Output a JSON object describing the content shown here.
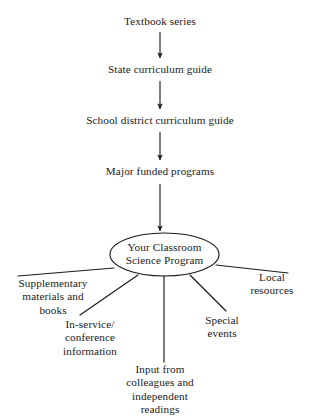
{
  "diagram": {
    "type": "flow-and-radial-diagram",
    "background_color": "#ffffff",
    "ink_color": "#1a1a1a",
    "flow": {
      "stages": [
        {
          "id": "textbook-series",
          "label": "Textbook series",
          "cx": 160,
          "cy": 22
        },
        {
          "id": "state-guide",
          "label": "State curriculum guide",
          "cx": 160,
          "cy": 70
        },
        {
          "id": "district-guide",
          "label": "School district curriculum guide",
          "cx": 160,
          "cy": 121
        },
        {
          "id": "funded-programs",
          "label": "Major funded programs",
          "cx": 160,
          "cy": 172
        }
      ],
      "arrows": [
        {
          "from": "textbook-series",
          "to": "state-guide",
          "x": 160,
          "y1": 32,
          "y2": 58
        },
        {
          "from": "state-guide",
          "to": "district-guide",
          "x": 160,
          "y1": 81,
          "y2": 109
        },
        {
          "from": "district-guide",
          "to": "funded-programs",
          "x": 160,
          "y1": 132,
          "y2": 160
        },
        {
          "from": "funded-programs",
          "to": "hub",
          "x": 160,
          "y1": 184,
          "y2": 231
        }
      ]
    },
    "hub": {
      "id": "classroom-science-program",
      "shape": "ellipse",
      "label": "Your Classroom\nScience Program",
      "cx": 164.5,
      "cy": 254.5,
      "rx": 54.5,
      "ry": 21.5
    },
    "branches": [
      {
        "id": "supplementary-materials",
        "label": "Supplementary\nmaterials and\nbooks",
        "line": {
          "x1": 114,
          "y1": 268,
          "x2": 18,
          "y2": 276
        },
        "text": {
          "x": 53,
          "y": 277,
          "anchor": "center"
        }
      },
      {
        "id": "in-service-conference",
        "label": "In-service/\nconference\ninformation",
        "line": {
          "x1": 138,
          "y1": 275,
          "x2": 80,
          "y2": 315
        },
        "text": {
          "x": 90,
          "y": 318,
          "anchor": "center"
        }
      },
      {
        "id": "input-from-colleagues",
        "label": "Input from\ncolleagues and\nindependent\nreadings",
        "line": {
          "x1": 164,
          "y1": 276,
          "x2": 164,
          "y2": 362
        },
        "text": {
          "x": 160,
          "y": 363,
          "anchor": "center"
        }
      },
      {
        "id": "special-events",
        "label": "Special\nevents",
        "line": {
          "x1": 190,
          "y1": 275,
          "x2": 226,
          "y2": 311
        },
        "text": {
          "x": 222,
          "y": 314,
          "anchor": "center"
        }
      },
      {
        "id": "local-resources",
        "label": "Local\nresources",
        "line": {
          "x1": 216,
          "y1": 265,
          "x2": 288,
          "y2": 273
        },
        "text": {
          "x": 272,
          "y": 271,
          "anchor": "center"
        }
      }
    ]
  }
}
